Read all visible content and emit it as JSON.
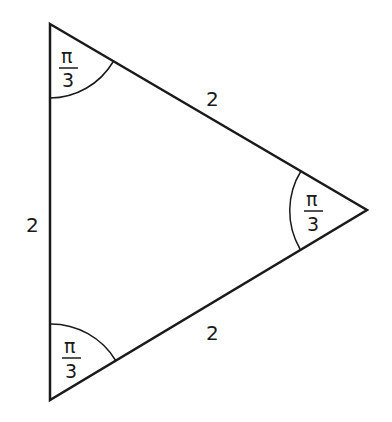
{
  "diagram": {
    "type": "equilateral-triangle",
    "vertices": {
      "top": [
        50,
        24
      ],
      "right": [
        367,
        210
      ],
      "bottom": [
        50,
        400
      ]
    },
    "side_labels": {
      "left": "2",
      "top_right": "2",
      "bottom_right": "2"
    },
    "angle_labels": {
      "top": {
        "numerator": "π",
        "denominator": "3"
      },
      "right": {
        "numerator": "π",
        "denominator": "3"
      },
      "bottom": {
        "numerator": "π",
        "denominator": "3"
      }
    },
    "stroke_color": "#1a1a1a",
    "background": "#ffffff"
  }
}
